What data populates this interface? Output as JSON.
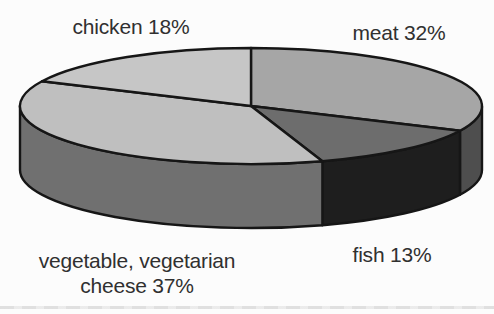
{
  "page": {
    "background": "#fcfcfc",
    "scan_line_color": "#cccccc"
  },
  "chart_data": {
    "type": "pie",
    "style": "3d",
    "title": "",
    "unit": "%",
    "start_angle_deg": 0,
    "direction": "clockwise",
    "outline_color": "#161616",
    "slices": [
      {
        "name": "meat",
        "label": "meat 32%",
        "value": 32,
        "top_color": "#a6a6a6",
        "side_color": "#4e4e4e"
      },
      {
        "name": "fish",
        "label": "fish 13%",
        "value": 13,
        "top_color": "#6d6d6d",
        "side_color": "#1e1e1e"
      },
      {
        "name": "vegetable-vegetarian-cheese",
        "label": "vegetable, vegetarian cheese 37%",
        "value": 37,
        "top_color": "#bfbfbf",
        "side_color": "#707070"
      },
      {
        "name": "chicken",
        "label": "chicken 18%",
        "value": 18,
        "top_color": "#c6c6c6",
        "side_color": "#9a9a9a"
      }
    ]
  },
  "labels": {
    "chicken": "chicken 18%",
    "meat": "meat 32%",
    "fish": "fish 13%",
    "vegetable_line1": "vegetable, vegetarian",
    "vegetable_line2": "cheese 37%"
  }
}
